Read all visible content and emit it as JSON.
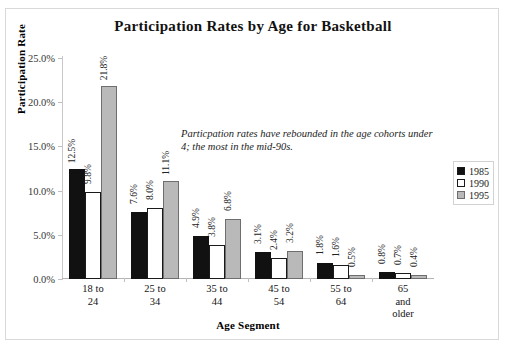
{
  "chart_data": {
    "type": "bar",
    "title": "Participation Rates by Age for Basketball",
    "xlabel": "Age Segment",
    "ylabel": "Participation Rate",
    "categories": [
      "18 to 24",
      "25 to 34",
      "35 to 44",
      "45 to 54",
      "55 to 64",
      "65 and older"
    ],
    "category_lines": [
      [
        "18 to",
        "24"
      ],
      [
        "25 to",
        "34"
      ],
      [
        "35 to",
        "44"
      ],
      [
        "45 to",
        "54"
      ],
      [
        "55 to",
        "64"
      ],
      [
        "65",
        "and",
        "older"
      ]
    ],
    "series": [
      {
        "name": "1985",
        "color": "#111111",
        "values": [
          12.5,
          7.6,
          4.9,
          3.1,
          1.8,
          0.8
        ],
        "labels": [
          "12.5%",
          "7.6%",
          "4.9%",
          "3.1%",
          "1.8%",
          "0.8%"
        ]
      },
      {
        "name": "1990",
        "color": "#ffffff",
        "values": [
          9.8,
          8.0,
          3.8,
          2.4,
          1.6,
          0.7
        ],
        "labels": [
          "9.8%",
          "8.0%",
          "3.8%",
          "2.4%",
          "1.6%",
          "0.7%"
        ]
      },
      {
        "name": "1995",
        "color": "#b9b9b9",
        "values": [
          21.8,
          11.1,
          6.8,
          3.2,
          0.5,
          0.4
        ],
        "labels": [
          "21.8%",
          "11.1%",
          "6.8%",
          "3.2%",
          "0.5%",
          "0.4%"
        ]
      }
    ],
    "ylim": [
      0,
      25
    ],
    "yticks": [
      0,
      5,
      10,
      15,
      20,
      25
    ],
    "ytick_labels": [
      "0.0%",
      "5.0%",
      "10.0%",
      "15.0%",
      "20.0%",
      "25.0%"
    ],
    "grid": false,
    "legend_position": "right",
    "annotations": [
      "Particpation rates have rebounded in the age cohorts under 4; the most in the mid-90s."
    ]
  },
  "legend": {
    "entries": [
      {
        "label": "1985"
      },
      {
        "label": "1990"
      },
      {
        "label": "1995"
      }
    ]
  },
  "footer": {
    "note": ""
  }
}
